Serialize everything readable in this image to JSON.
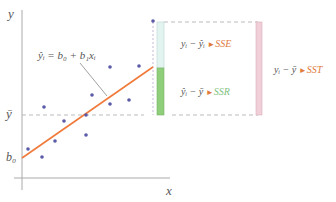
{
  "diagram": {
    "axes": {
      "y_label": "y",
      "x_label": "x",
      "ybar_label": "ȳ",
      "intercept_label": "b₀"
    },
    "regression_equation": "ŷᵢ = b₀ + b₁xᵢ",
    "terms": {
      "sse": {
        "expr": "yᵢ − ŷᵢ",
        "arrow": "►",
        "name": "SSE",
        "color": "#e07b3c"
      },
      "ssr": {
        "expr": "ŷᵢ − ȳ",
        "arrow": "►",
        "name": "SSR",
        "color": "#7fc37f"
      },
      "sst": {
        "expr": "yᵢ − ȳ",
        "arrow": "►",
        "name": "SST",
        "color": "#e07b3c"
      }
    },
    "colors": {
      "regression_line": "#f07a3a",
      "points": "#5a5aa8",
      "sse_bar": "#e3f3ef",
      "ssr_bar": "#8fce7a",
      "sst_bar": "#f0cfd8",
      "axis": "#999999",
      "dashed": "#aaaaaa"
    }
  }
}
